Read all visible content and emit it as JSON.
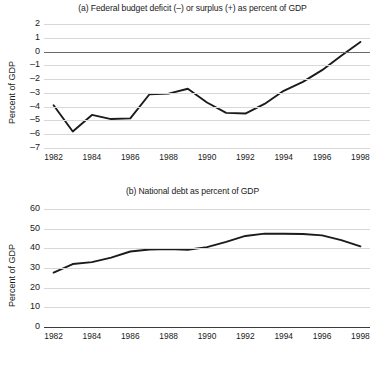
{
  "figure": {
    "axis_label": "Percent of GDP"
  },
  "chart_data": [
    {
      "type": "line",
      "title": "(a) Federal budget deficit (–) or surplus (+) as percent of GDP",
      "xlabel": "",
      "ylabel": "Percent of GDP",
      "grid": true,
      "legend": "none",
      "xlim": [
        1981.5,
        1998.5
      ],
      "ylim": [
        -7,
        2
      ],
      "yticks": [
        2,
        1,
        0,
        -1,
        -2,
        -3,
        -4,
        -5,
        -6,
        -7
      ],
      "ytick_labels": [
        "2",
        "1",
        "0",
        "–1",
        "–2",
        "–3",
        "–4",
        "–5",
        "–6",
        "–7"
      ],
      "xticks": [
        1982,
        1984,
        1986,
        1988,
        1990,
        1992,
        1994,
        1996,
        1998
      ],
      "xtick_labels": [
        "1982",
        "1984",
        "1986",
        "1988",
        "1990",
        "1992",
        "1994",
        "1996",
        "1998"
      ],
      "zero_line": 0,
      "x": [
        1982,
        1983,
        1984,
        1985,
        1986,
        1987,
        1988,
        1989,
        1990,
        1991,
        1992,
        1993,
        1994,
        1995,
        1996,
        1997,
        1998
      ],
      "values": [
        -3.9,
        -5.8,
        -4.6,
        -4.9,
        -4.85,
        -3.1,
        -3.05,
        -2.7,
        -3.7,
        -4.45,
        -4.5,
        -3.8,
        -2.85,
        -2.2,
        -1.35,
        -0.3,
        0.7
      ],
      "series": [
        {
          "name": "Federal budget deficit or surplus",
          "values": [
            -3.9,
            -5.8,
            -4.6,
            -4.9,
            -4.85,
            -3.1,
            -3.05,
            -2.7,
            -3.7,
            -4.45,
            -4.5,
            -3.8,
            -2.85,
            -2.2,
            -1.35,
            -0.3,
            0.7
          ]
        }
      ]
    },
    {
      "type": "line",
      "title": "(b) National debt as percent of GDP",
      "xlabel": "",
      "ylabel": "Percent of GDP",
      "grid": true,
      "legend": "none",
      "xlim": [
        1981.5,
        1998.5
      ],
      "ylim": [
        0,
        60
      ],
      "yticks": [
        60,
        50,
        40,
        30,
        20,
        10,
        0
      ],
      "ytick_labels": [
        "60",
        "50",
        "40",
        "30",
        "20",
        "10",
        "0"
      ],
      "xticks": [
        1982,
        1984,
        1986,
        1988,
        1990,
        1992,
        1994,
        1996,
        1998
      ],
      "xtick_labels": [
        "1982",
        "1984",
        "1986",
        "1988",
        "1990",
        "1992",
        "1994",
        "1996",
        "1998"
      ],
      "x": [
        1982,
        1983,
        1984,
        1985,
        1986,
        1987,
        1988,
        1989,
        1990,
        1991,
        1992,
        1993,
        1994,
        1995,
        1996,
        1997,
        1998
      ],
      "values": [
        27.7,
        32.0,
        33.0,
        35.3,
        38.4,
        39.4,
        39.6,
        39.3,
        40.6,
        43.3,
        46.3,
        47.5,
        47.4,
        47.3,
        46.6,
        44.2,
        41.0
      ],
      "series": [
        {
          "name": "National debt",
          "values": [
            27.7,
            32.0,
            33.0,
            35.3,
            38.4,
            39.4,
            39.6,
            39.3,
            40.6,
            43.3,
            46.3,
            47.5,
            47.4,
            47.3,
            46.6,
            44.2,
            41.0
          ]
        }
      ]
    }
  ]
}
